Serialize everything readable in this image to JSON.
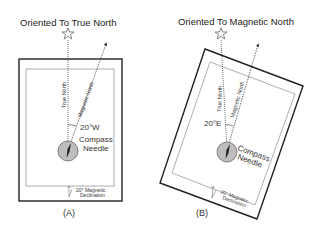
{
  "panel_a": {
    "title": "Oriented To True North",
    "true_north_label": "True North",
    "magnetic_north_label": "Magnetic North",
    "angle_label": "20°W",
    "compass_label_line1": "Compass",
    "compass_label_line2": "Needle",
    "declination_line1": "20° Magnetic",
    "declination_line2": "Declination",
    "panel_label": "(A)"
  },
  "panel_b": {
    "title": "Oriented To Magnetic North",
    "true_north_label": "True North",
    "magnetic_north_label": "Magnetic North",
    "angle_label": "20°E",
    "compass_label_line1": "Compass",
    "compass_label_line2": "Needle",
    "declination_line1": "20° Magnetic",
    "declination_line2": "Declination",
    "panel_label": "(B)"
  },
  "colors": {
    "line": "#222222",
    "frame_inner": "#9a9a9a",
    "compass_fill": "#bdbdbd"
  }
}
